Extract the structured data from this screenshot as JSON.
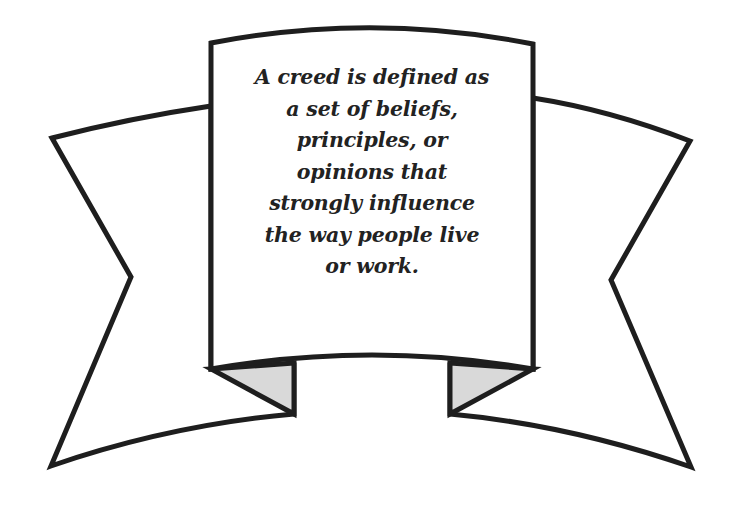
{
  "banner": {
    "lines": [
      "A creed is defined as",
      "a set of beliefs,",
      "principles, or",
      "opinions that",
      "strongly influence",
      "the way people live",
      "or work."
    ]
  },
  "colors": {
    "stroke": "#1e1e1e",
    "fill": "#ffffff",
    "fold_fill": "#d9d9d9",
    "text": "#222222"
  }
}
